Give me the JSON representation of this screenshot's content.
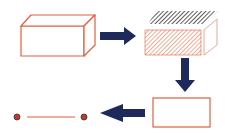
{
  "diagram": {
    "colors": {
      "shape_stroke": "#e0603f",
      "arrow_fill": "#1f2a5c",
      "hatch_top": "#333333",
      "hatch_front": "#e88a6e",
      "point_fill": "#c0392b",
      "background": "#ffffff"
    },
    "nodes": [
      {
        "id": "cuboid",
        "kind": "3d-box"
      },
      {
        "id": "sliced-cuboid",
        "kind": "3d-box-hatched"
      },
      {
        "id": "rectangle",
        "kind": "2d-rectangle"
      },
      {
        "id": "segment",
        "kind": "1d-line-segment"
      }
    ],
    "arrows": [
      {
        "from": "cuboid",
        "to": "sliced-cuboid",
        "direction": "right"
      },
      {
        "from": "sliced-cuboid",
        "to": "rectangle",
        "direction": "down"
      },
      {
        "from": "rectangle",
        "to": "segment",
        "direction": "left"
      }
    ]
  }
}
